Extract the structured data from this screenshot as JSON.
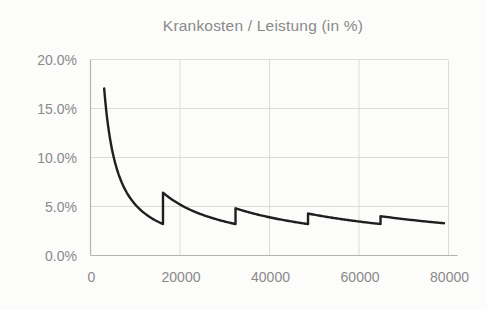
{
  "chart_data": {
    "type": "line",
    "title": "Krankosten / Leistung (in %)",
    "legend": "none",
    "grid": true,
    "x_axis": {
      "min": 0,
      "max": 82000,
      "tick_values": [
        0,
        20000,
        40000,
        60000,
        80000
      ],
      "tick_labels": [
        "0",
        "20000",
        "40000",
        "60000",
        "80000"
      ],
      "gridline_values": [
        20000,
        40000,
        60000,
        80000
      ]
    },
    "y_axis": {
      "min": 0,
      "max": 20,
      "tick_values": [
        0,
        5,
        10,
        15,
        20
      ],
      "tick_labels": [
        "0.0%",
        "5.0%",
        "10.0%",
        "15.0%",
        "20.0%"
      ],
      "gridline_values": [
        5,
        10,
        15,
        20
      ]
    },
    "series": [
      {
        "name": "Krankosten / Leistung",
        "shape": "sawtooth-hyperbolic",
        "formula_percent": "y = 100 * numerator / x",
        "segments": [
          {
            "x_start": 3050,
            "x_end": 16200,
            "numerator": 520
          },
          {
            "x_start": 16200,
            "x_end": 32400,
            "numerator": 1040
          },
          {
            "x_start": 32400,
            "x_end": 48600,
            "numerator": 1560
          },
          {
            "x_start": 48600,
            "x_end": 64800,
            "numerator": 2080
          },
          {
            "x_start": 64800,
            "x_end": 79000,
            "numerator": 2600
          }
        ],
        "key_points_percent": [
          {
            "x": 3050,
            "y": 17.0
          },
          {
            "x": 16200,
            "y_before": 3.2,
            "y_after": 6.4
          },
          {
            "x": 32400,
            "y_before": 3.2,
            "y_after": 4.8
          },
          {
            "x": 48600,
            "y_before": 3.2,
            "y_after": 4.3
          },
          {
            "x": 64800,
            "y_before": 3.2,
            "y_after": 4.0
          },
          {
            "x": 79000,
            "y": 3.3
          }
        ]
      }
    ],
    "colors": {
      "line": "#1f1f1f",
      "gridline": "#dcdcd7",
      "axis_line": "#b4b4af",
      "text": "#8a8a8a",
      "background": "#fcfcfa"
    }
  }
}
